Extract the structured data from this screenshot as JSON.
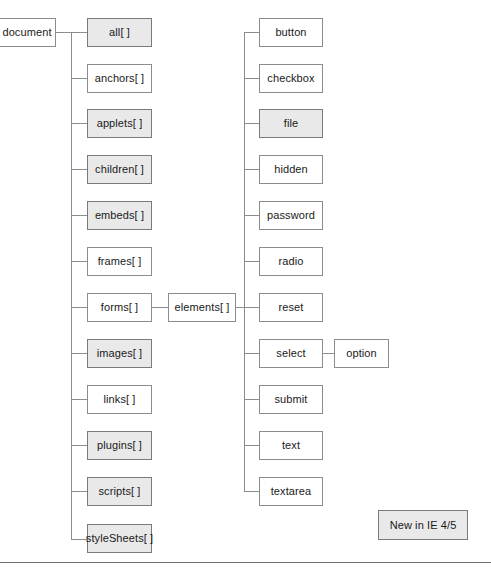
{
  "diagram": {
    "legend": {
      "label": "New in IE 4/5",
      "shaded_meaning": "New in IE 4/5",
      "shaded_fill": "#e9e9e9",
      "plain_fill": "#ffffff",
      "border_color": "#8d8d8d"
    },
    "root": {
      "label": "document",
      "shaded": false
    },
    "collections": [
      {
        "label": "all[ ]",
        "shaded": true
      },
      {
        "label": "anchors[ ]",
        "shaded": false
      },
      {
        "label": "applets[ ]",
        "shaded": true
      },
      {
        "label": "children[ ]",
        "shaded": true
      },
      {
        "label": "embeds[ ]",
        "shaded": true
      },
      {
        "label": "frames[ ]",
        "shaded": false
      },
      {
        "label": "forms[ ]",
        "shaded": false
      },
      {
        "label": "images[ ]",
        "shaded": true
      },
      {
        "label": "links[ ]",
        "shaded": false
      },
      {
        "label": "plugins[ ]",
        "shaded": true
      },
      {
        "label": "scripts[ ]",
        "shaded": true
      },
      {
        "label": "styleSheets[ ]",
        "shaded": true
      }
    ],
    "elements": {
      "label": "elements[ ]",
      "shaded": false,
      "parent": "forms[ ]"
    },
    "element_types": [
      {
        "label": "button",
        "shaded": false
      },
      {
        "label": "checkbox",
        "shaded": false
      },
      {
        "label": "file",
        "shaded": true
      },
      {
        "label": "hidden",
        "shaded": false
      },
      {
        "label": "password",
        "shaded": false
      },
      {
        "label": "radio",
        "shaded": false
      },
      {
        "label": "reset",
        "shaded": false
      },
      {
        "label": "select",
        "shaded": false
      },
      {
        "label": "submit",
        "shaded": false
      },
      {
        "label": "text",
        "shaded": false
      },
      {
        "label": "textarea",
        "shaded": false
      }
    ],
    "option": {
      "label": "option",
      "shaded": false,
      "parent": "select"
    }
  }
}
